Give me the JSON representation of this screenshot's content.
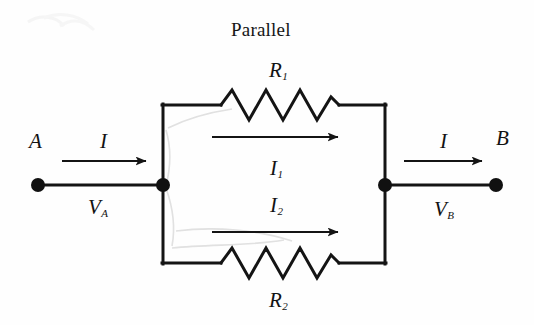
{
  "figure": {
    "title": "Parallel",
    "type": "electrical-circuit-diagram"
  },
  "labels": {
    "node_a": "A",
    "node_b": "B",
    "current_in": "I",
    "current_out": "I",
    "voltage_a": "V",
    "voltage_a_sub": "A",
    "voltage_b": "V",
    "voltage_b_sub": "B",
    "branch_current_1": "I",
    "branch_current_1_sub": "1",
    "branch_current_2": "I",
    "branch_current_2_sub": "2",
    "resistor_1": "R",
    "resistor_1_sub": "1",
    "resistor_2": "R",
    "resistor_2_sub": "2"
  },
  "colors": {
    "ink": "#111111",
    "background": "#fefefe",
    "pencil": "#d9d9d9"
  },
  "geometry": {
    "left_terminal": [
      38,
      185
    ],
    "left_junction": [
      163,
      185
    ],
    "right_junction": [
      385,
      185
    ],
    "right_terminal": [
      496,
      185
    ],
    "top_rail_y": 105,
    "bottom_rail_y": 263,
    "left_rail_x": 163,
    "right_rail_x": 385
  }
}
